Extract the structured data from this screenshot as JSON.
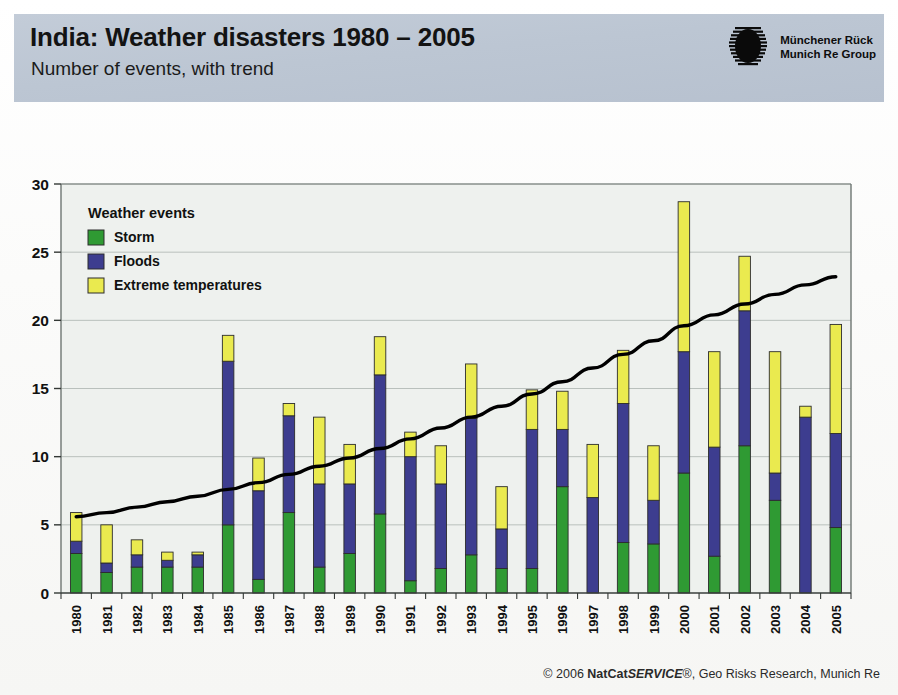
{
  "header": {
    "title": "India: Weather disasters 1980 – 2005",
    "subtitle": "Number of events, with trend",
    "logo_icon": "munich-re-logo-icon",
    "logo_line1": "Münchener Rück",
    "logo_line2": "Munich Re Group"
  },
  "footer": {
    "copyright_symbol": "©",
    "year": "2006",
    "brand_bold": "NatCat",
    "brand_italic": "SERVICE",
    "registered": "®",
    "rest": ", Geo Risks Research, Munich Re"
  },
  "colors": {
    "storm": "#2f9a33",
    "floods": "#3d3d8f",
    "extreme": "#eaea4f",
    "trend": "#000000",
    "header_band": "#bdc7d4",
    "plot_bg": "#eef1ee",
    "grid": "#b9c0bc",
    "axis": "#6e7672"
  },
  "chart_data": {
    "type": "bar",
    "subtype": "stacked-bar-with-trendline",
    "title": "India: Weather disasters 1980 – 2005",
    "subtitle": "Number of events, with trend",
    "xlabel": "",
    "ylabel": "",
    "ylim": [
      0,
      30
    ],
    "yticks": [
      0,
      5,
      10,
      15,
      20,
      25,
      30
    ],
    "grid": true,
    "legend_position": "top-left-inside",
    "legend_title": "Weather events",
    "categories": [
      "1980",
      "1981",
      "1982",
      "1983",
      "1984",
      "1985",
      "1986",
      "1987",
      "1988",
      "1989",
      "1990",
      "1991",
      "1992",
      "1993",
      "1994",
      "1995",
      "1996",
      "1997",
      "1998",
      "1999",
      "2000",
      "2001",
      "2002",
      "2003",
      "2004",
      "2005"
    ],
    "series": [
      {
        "name": "Storm",
        "color": "#2f9a33",
        "values": [
          2.9,
          1.5,
          1.9,
          1.9,
          1.9,
          5.0,
          1.0,
          5.9,
          1.9,
          2.9,
          5.8,
          0.9,
          1.8,
          2.8,
          1.8,
          1.8,
          7.8,
          0.0,
          3.7,
          3.6,
          8.8,
          2.7,
          10.8,
          6.8,
          0.0,
          4.8
        ]
      },
      {
        "name": "Floods",
        "color": "#3d3d8f",
        "values": [
          0.9,
          0.7,
          0.9,
          0.5,
          0.9,
          12.0,
          6.5,
          7.1,
          6.1,
          5.1,
          10.2,
          9.1,
          6.2,
          10.0,
          2.9,
          10.2,
          4.2,
          7.0,
          10.2,
          3.2,
          8.9,
          8.0,
          9.9,
          2.0,
          12.9,
          6.9
        ]
      },
      {
        "name": "Extreme  temperatures",
        "color": "#eaea4f",
        "values": [
          2.1,
          2.8,
          1.1,
          0.6,
          0.2,
          1.9,
          2.4,
          0.9,
          4.9,
          2.9,
          2.8,
          1.8,
          2.8,
          4.0,
          3.1,
          2.9,
          2.8,
          3.9,
          3.9,
          4.0,
          11.0,
          7.0,
          4.0,
          8.9,
          0.8,
          8.0
        ]
      }
    ],
    "totals": [
      5.9,
      5.0,
      3.9,
      3.0,
      3.0,
      18.9,
      9.9,
      13.9,
      12.9,
      10.9,
      18.8,
      11.8,
      10.8,
      16.8,
      7.8,
      14.9,
      14.8,
      10.9,
      17.8,
      10.8,
      28.7,
      17.7,
      24.7,
      17.7,
      13.7,
      19.7
    ],
    "trend": {
      "name": "trend",
      "style": "thick-black-curve",
      "x": [
        "1980",
        "1981",
        "1982",
        "1983",
        "1984",
        "1985",
        "1986",
        "1987",
        "1988",
        "1989",
        "1990",
        "1991",
        "1992",
        "1993",
        "1994",
        "1995",
        "1996",
        "1997",
        "1998",
        "1999",
        "2000",
        "2001",
        "2002",
        "2003",
        "2004",
        "2005"
      ],
      "values": [
        5.6,
        5.9,
        6.3,
        6.7,
        7.1,
        7.6,
        8.1,
        8.7,
        9.3,
        9.9,
        10.6,
        11.3,
        12.1,
        12.9,
        13.7,
        14.6,
        15.5,
        16.5,
        17.5,
        18.5,
        19.6,
        20.4,
        21.2,
        21.9,
        22.6,
        23.2
      ]
    }
  }
}
